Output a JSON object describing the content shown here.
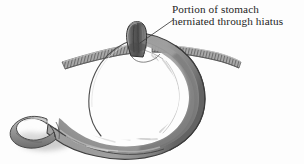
{
  "figure": {
    "background_color": "#fdfdfd",
    "width": 304,
    "height": 164
  },
  "caption": {
    "line1": "Portion of stomach",
    "line2": "herniated through hiatus",
    "text_color": "#1d1d1d"
  },
  "leader_line": {
    "name": "leader-line",
    "from_x": 173,
    "from_y": 20,
    "to_x": 140,
    "to_y": 43,
    "color": "#3a3a3a"
  },
  "structures": [
    {
      "name": "herniated-stomach-portion",
      "label": "Portion of stomach herniated through hiatus",
      "fill": "#6f6f6f",
      "outline": "#3b3b3b"
    },
    {
      "name": "diaphragm",
      "label": "Diaphragm",
      "fill": "#a9a9a9",
      "outline": "#555555",
      "hatching": "true"
    },
    {
      "name": "stomach-body",
      "label": "Stomach body",
      "fill": "#9c9c9c",
      "outline": "#4a4a4a"
    },
    {
      "name": "gastric-rugae",
      "label": "Gastric rugae folds",
      "fill": "#b8b8b8",
      "outline": "#8a8a8a"
    },
    {
      "name": "pylorus",
      "label": "Pylorus",
      "fill": "#979797",
      "outline": "#4a4a4a"
    },
    {
      "name": "duodenum",
      "label": "Duodenum",
      "fill": "#9a9a9a",
      "outline": "#4a4a4a"
    },
    {
      "name": "drop-shadow",
      "label": "Shadow",
      "fill": "#b5b5b5"
    }
  ],
  "palette": {
    "background": "#fdfdfd",
    "ink": "#1d1d1d",
    "stomach_mid": "#9c9c9c",
    "stomach_light": "#c4c4c4",
    "stomach_dark": "#5d5d5d",
    "outline": "#454545",
    "diaphragm": "#a4a4a4",
    "highlight": "#d8d8d8"
  }
}
